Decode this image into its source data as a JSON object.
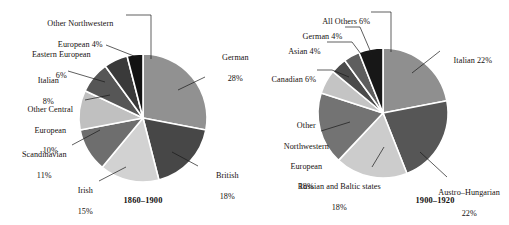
{
  "figure": {
    "background": "#ffffff",
    "panels": [
      {
        "id": "left",
        "caption": "1860–1900",
        "labels": [
          {
            "name": "label-other-northwestern-european",
            "line1": "Other Northwestern",
            "line2": "European 4%"
          },
          {
            "name": "label-eastern-european",
            "line1": "Eastern European",
            "line2": "6%"
          },
          {
            "name": "label-italian",
            "line1": "Italian",
            "line2": "8%"
          },
          {
            "name": "label-other-central-european",
            "line1": "Other Central",
            "line2": "European",
            "line3": "10%"
          },
          {
            "name": "label-scandinavian",
            "line1": "Scandinavian",
            "line2": "11%"
          },
          {
            "name": "label-irish",
            "line1": "Irish",
            "line2": "15%"
          },
          {
            "name": "label-british",
            "line1": "British",
            "line2": "18%"
          },
          {
            "name": "label-german",
            "line1": "German",
            "line2": "28%"
          }
        ]
      },
      {
        "id": "right",
        "caption": "1900–1920",
        "labels": [
          {
            "name": "label-all-others",
            "line1": "All Others 6%"
          },
          {
            "name": "label-german",
            "line1": "German 4%"
          },
          {
            "name": "label-asian",
            "line1": "Asian 4%"
          },
          {
            "name": "label-canadian",
            "line1": "Canadian 6%"
          },
          {
            "name": "label-other-northwestern-european",
            "line1": "Other",
            "line2": "Northwestern",
            "line3": "European",
            "line4": "18%"
          },
          {
            "name": "label-russian-and-baltic-states",
            "line1": "Russian and Baltic states",
            "line2": "18%"
          },
          {
            "name": "label-austro-hungarian",
            "line1": "Austro–Hungarian",
            "line2": "22%"
          },
          {
            "name": "label-italian",
            "line1": "Italian 22%"
          }
        ]
      }
    ]
  },
  "chart_data": [
    {
      "type": "pie",
      "title": "1860–1900",
      "id": "pie-1860-1900",
      "unit": "percent",
      "start_angle_deg": -90,
      "direction": "clockwise",
      "center": {
        "cx": 143,
        "cy": 118
      },
      "radius": 64,
      "labels": [
        "German",
        "British",
        "Irish",
        "Scandinavian",
        "Other Central European",
        "Italian",
        "Eastern European",
        "Other Northwestern European"
      ],
      "values": [
        28,
        18,
        15,
        11,
        10,
        8,
        6,
        4
      ],
      "value_text": [
        "28%",
        "18%",
        "15%",
        "11%",
        "10%",
        "8%",
        "6%",
        "4%"
      ],
      "colors": [
        "#919191",
        "#474747",
        "#d2d2d2",
        "#6e6e6e",
        "#c0c0c0",
        "#565656",
        "#3a3a3a",
        "#121212"
      ],
      "slice_gap_color": "#ffffff"
    },
    {
      "type": "pie",
      "title": "1900–1920",
      "id": "pie-1900-1920",
      "unit": "percent",
      "start_angle_deg": -90,
      "direction": "clockwise",
      "center": {
        "cx": 383,
        "cy": 113
      },
      "radius": 65,
      "labels": [
        "Italian",
        "Austro–Hungarian",
        "Russian and Baltic states",
        "Other Northwestern European",
        "Canadian",
        "Asian",
        "German",
        "All Others"
      ],
      "values": [
        22,
        22,
        18,
        18,
        6,
        4,
        4,
        6
      ],
      "value_text": [
        "22%",
        "22%",
        "18%",
        "18%",
        "6%",
        "4%",
        "4%",
        "6%"
      ],
      "colors": [
        "#8f8f8f",
        "#565656",
        "#cccccc",
        "#737373",
        "#c4c4c4",
        "#4b4b4b",
        "#5e5e5e",
        "#171717"
      ],
      "slice_gap_color": "#ffffff"
    }
  ]
}
